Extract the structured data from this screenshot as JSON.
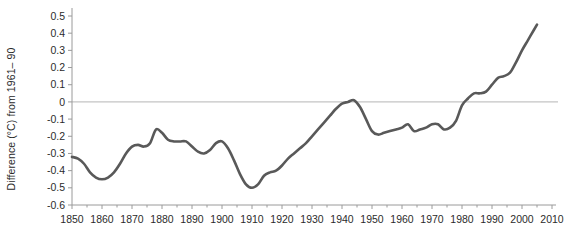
{
  "chart_data": {
    "type": "line",
    "title": "",
    "xlabel": "",
    "ylabel": "Difference (°C) from 1961– 90",
    "xlim": [
      1850,
      2010
    ],
    "ylim": [
      -0.6,
      0.5
    ],
    "xticks": [
      1850,
      1860,
      1870,
      1880,
      1890,
      1900,
      1910,
      1920,
      1930,
      1940,
      1950,
      1960,
      1970,
      1980,
      1990,
      2000,
      2010
    ],
    "xtick_labels": [
      "1850",
      "1860",
      "1870",
      "1880",
      "1890",
      "1900",
      "1910",
      "1920",
      "1930",
      "1940",
      "1950",
      "1960",
      "1970",
      "1980",
      "1990",
      "2000",
      "2010"
    ],
    "yticks": [
      0.5,
      0.4,
      0.3,
      0.2,
      0.1,
      0,
      -0.1,
      -0.2,
      -0.3,
      -0.4,
      -0.5,
      -0.6
    ],
    "ytick_labels": [
      "0.5",
      "0.4",
      "0.3",
      "0.2",
      "0.1",
      "0",
      "-0.1",
      "-0.2",
      "-0.3",
      "-0.4",
      "-0.5",
      "-0.6"
    ],
    "minor_xtick_interval": 5,
    "grid": false,
    "legend": null,
    "zero_reference_line": 0,
    "line_color": "#595959",
    "zero_line_color": "#b5b5b5",
    "axis_color": "#9a9a9a",
    "line_width": 2.6,
    "series": [
      {
        "name": "Global mean temperature anomaly (smoothed)",
        "x": [
          1850,
          1852,
          1854,
          1856,
          1858,
          1860,
          1862,
          1864,
          1866,
          1868,
          1870,
          1872,
          1874,
          1876,
          1878,
          1880,
          1882,
          1884,
          1886,
          1888,
          1890,
          1892,
          1894,
          1896,
          1898,
          1900,
          1902,
          1904,
          1906,
          1908,
          1910,
          1912,
          1914,
          1916,
          1918,
          1920,
          1922,
          1924,
          1926,
          1928,
          1930,
          1932,
          1934,
          1936,
          1938,
          1940,
          1942,
          1944,
          1946,
          1948,
          1950,
          1952,
          1954,
          1956,
          1958,
          1960,
          1962,
          1964,
          1966,
          1968,
          1970,
          1972,
          1974,
          1976,
          1978,
          1980,
          1982,
          1984,
          1986,
          1988,
          1990,
          1992,
          1994,
          1996,
          1998,
          2000,
          2002,
          2004,
          2005
        ],
        "values": [
          -0.32,
          -0.33,
          -0.36,
          -0.41,
          -0.44,
          -0.45,
          -0.44,
          -0.41,
          -0.36,
          -0.3,
          -0.26,
          -0.25,
          -0.26,
          -0.24,
          -0.16,
          -0.18,
          -0.22,
          -0.23,
          -0.23,
          -0.23,
          -0.26,
          -0.29,
          -0.3,
          -0.28,
          -0.24,
          -0.23,
          -0.27,
          -0.34,
          -0.42,
          -0.48,
          -0.5,
          -0.48,
          -0.43,
          -0.41,
          -0.4,
          -0.37,
          -0.33,
          -0.3,
          -0.27,
          -0.24,
          -0.2,
          -0.16,
          -0.12,
          -0.08,
          -0.04,
          -0.01,
          0.0,
          0.01,
          -0.03,
          -0.1,
          -0.17,
          -0.19,
          -0.18,
          -0.17,
          -0.16,
          -0.15,
          -0.13,
          -0.17,
          -0.16,
          -0.15,
          -0.13,
          -0.13,
          -0.16,
          -0.15,
          -0.11,
          -0.02,
          0.02,
          0.05,
          0.05,
          0.06,
          0.1,
          0.14,
          0.15,
          0.17,
          0.23,
          0.3,
          0.36,
          0.42,
          0.45
        ]
      }
    ]
  }
}
